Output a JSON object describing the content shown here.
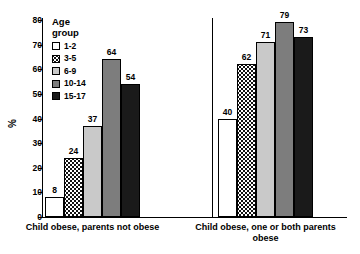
{
  "chart_data": {
    "type": "bar",
    "title": "",
    "xlabel": "",
    "ylabel": "%",
    "ylim": [
      0,
      80
    ],
    "yticks": [
      "0",
      "10",
      "20",
      "30",
      "40",
      "50",
      "60",
      "70",
      "80"
    ],
    "grid": false,
    "legend_position": "inside-top-left",
    "legend_title_line1": "Age",
    "legend_title_line2": "group",
    "categories": [
      "Child obese, parents not obese",
      "Child obese, one or both parents obese"
    ],
    "series": [
      {
        "name": "1-2",
        "swatch": "white",
        "color": "#ffffff",
        "values": [
          8,
          40
        ]
      },
      {
        "name": "3-5",
        "swatch": "dotted",
        "color": "#ffffff",
        "values": [
          24,
          62
        ]
      },
      {
        "name": "6-9",
        "swatch": "light-gray",
        "color": "#c9c9c9",
        "values": [
          37,
          71
        ]
      },
      {
        "name": "10-14",
        "swatch": "medium-gray",
        "color": "#7d7d7d",
        "values": [
          64,
          79
        ]
      },
      {
        "name": "15-17",
        "swatch": "black",
        "color": "#1a1a1a",
        "values": [
          54,
          73
        ]
      }
    ]
  }
}
